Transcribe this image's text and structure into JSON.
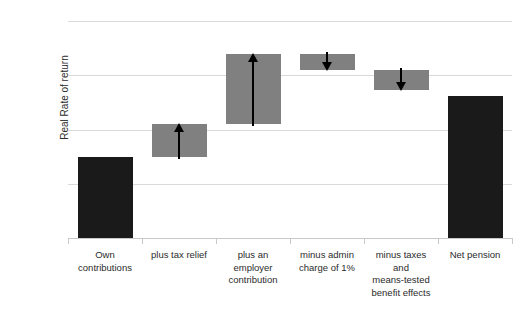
{
  "chart_data": {
    "type": "bar",
    "subtype": "waterfall",
    "title": "",
    "xlabel": "",
    "ylabel": "Real Rate of return",
    "ylim": [
      0,
      8
    ],
    "ytick_labels": [
      "0%",
      "2%",
      "4%",
      "6%",
      "8%"
    ],
    "ytick_values": [
      0,
      2,
      4,
      6,
      8
    ],
    "grid": true,
    "legend": false,
    "value_suffix": "%",
    "categories": [
      "Own contributions",
      "plus tax relief",
      "plus an employer contribution",
      "minus admin charge of 1%",
      "minus taxes and means-tested benefit effects",
      "Net pension"
    ],
    "category_lines": [
      [
        "Own",
        "contributions"
      ],
      [
        "plus tax relief"
      ],
      [
        "plus an",
        "employer",
        "contribution"
      ],
      [
        "minus admin",
        "charge of 1%"
      ],
      [
        "minus taxes",
        "and",
        "means-tested",
        "benefit effects"
      ],
      [
        "Net pension"
      ]
    ],
    "bars": [
      {
        "label": "Own contributions",
        "kind": "total",
        "base": 0.0,
        "top": 3.0,
        "delta": 3.0,
        "direction": "none",
        "color": "#1a1a1a"
      },
      {
        "label": "plus tax relief",
        "kind": "delta",
        "base": 3.0,
        "top": 4.2,
        "delta": 1.2,
        "direction": "up",
        "color": "#808080"
      },
      {
        "label": "plus an employer contribution",
        "kind": "delta",
        "base": 4.2,
        "top": 6.8,
        "delta": 2.6,
        "direction": "up",
        "color": "#808080"
      },
      {
        "label": "minus admin charge of 1%",
        "kind": "delta",
        "base": 6.2,
        "top": 6.8,
        "delta": -0.6,
        "direction": "down",
        "color": "#808080"
      },
      {
        "label": "minus taxes and means-tested benefit effects",
        "kind": "delta",
        "base": 5.45,
        "top": 6.2,
        "delta": -0.75,
        "direction": "down",
        "color": "#808080"
      },
      {
        "label": "Net pension",
        "kind": "total",
        "base": 0.0,
        "top": 5.25,
        "delta": 5.25,
        "direction": "none",
        "color": "#1a1a1a"
      }
    ],
    "colors": {
      "total_bar": "#1a1a1a",
      "delta_bar": "#808080",
      "gridline": "#d9d9d9",
      "axis": "#c9c9c9",
      "text": "#2b2b2b",
      "arrow": "#000000",
      "background": "#ffffff"
    }
  }
}
